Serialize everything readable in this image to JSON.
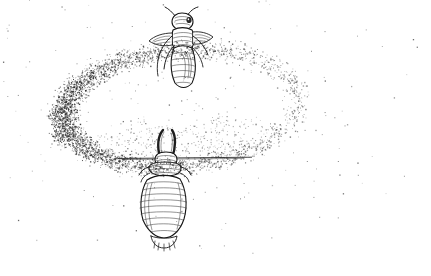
{
  "figure": {
    "caption": "",
    "medium": "pen-and-ink stipple drawing",
    "background_color": "#ffffff",
    "ink_color": "#1d1d1d",
    "stipple_color": "#2a2a2a",
    "width": 431,
    "height": 276
  },
  "subjects": [
    {
      "id": "adult-insect",
      "label": "adult insect",
      "position": "upper-center",
      "center_x": 182,
      "center_y": 48,
      "orientation": "head-up, body vertical",
      "parts": [
        "head",
        "antennae",
        "eye",
        "thorax",
        "wings",
        "legs",
        "abdomen"
      ]
    },
    {
      "id": "larva-insect",
      "label": "larval insect",
      "position": "lower-center",
      "center_x": 162,
      "center_y": 195,
      "orientation": "head-up, body vertical",
      "parts": [
        "paired curved antennae",
        "head capsule",
        "segmented thorax",
        "ringed abdomen",
        "fringed tail"
      ]
    }
  ],
  "halo": {
    "id": "stipple-ellipse",
    "label": "elliptical stipple halo",
    "center_x": 180,
    "center_y": 108,
    "radius_x": 118,
    "radius_y": 58,
    "rotation_deg": -5,
    "band_thickness": 26,
    "density_left": "dense",
    "density_right": "sparse",
    "interior": "empty"
  },
  "scatter": {
    "label": "sparse background speckle",
    "count": 520,
    "falloff": "radial, fading outward from halo"
  },
  "ground": {
    "label": "horizontal ground line",
    "y": 158,
    "x_start": 118,
    "x_end": 252
  }
}
